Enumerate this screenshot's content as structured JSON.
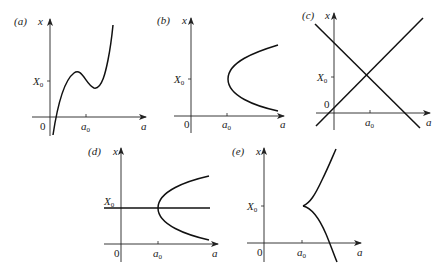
{
  "figure": {
    "panels": [
      {
        "id": "a",
        "label": "(a)",
        "x_axis": "a",
        "y_axis": "x",
        "y_tick": "X",
        "y_tick_sub": "0",
        "x_tick": "a",
        "x_tick_sub": "0",
        "origin": "0",
        "curve": "cubic S-curve with local max and min near X0"
      },
      {
        "id": "b",
        "label": "(b)",
        "x_axis": "a",
        "y_axis": "x",
        "y_tick": "X",
        "y_tick_sub": "0",
        "x_tick": "a",
        "x_tick_sub": "0",
        "origin": "0",
        "curve": "parabola opening right, vertex at (a0, X0)"
      },
      {
        "id": "c",
        "label": "(c)",
        "x_axis": "a",
        "y_axis": "x",
        "y_tick": "X",
        "y_tick_sub": "0",
        "x_tick": "a",
        "x_tick_sub": "0",
        "origin": "0",
        "curve": "two crossing lines intersecting at (a0, X0)"
      },
      {
        "id": "d",
        "label": "(d)",
        "x_axis": "a",
        "y_axis": "x",
        "y_tick": "X",
        "y_tick_sub": "0",
        "x_tick": "a",
        "x_tick_sub": "0",
        "origin": "0",
        "curve": "horizontal line x=X0 plus parabola opening right with vertex at (a0, X0)"
      },
      {
        "id": "e",
        "label": "(e)",
        "x_axis": "a",
        "y_axis": "x",
        "y_tick": "X",
        "y_tick_sub": "0",
        "x_tick": "a",
        "x_tick_sub": "0",
        "origin": "0",
        "curve": "cusp at (a0, X0) with upper and lower branches"
      }
    ]
  }
}
